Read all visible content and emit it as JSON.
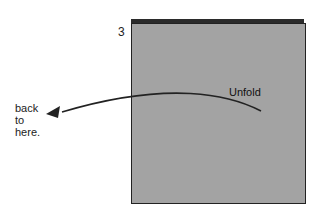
{
  "diagram": {
    "step_number": "3",
    "fold_label": "Unfold",
    "target_label": [
      "back",
      "to",
      "here."
    ],
    "colors": {
      "paper": "#a3a3a3",
      "paper_back": "#2b2b2b",
      "outline": "#222222",
      "arrow": "#222222"
    }
  }
}
